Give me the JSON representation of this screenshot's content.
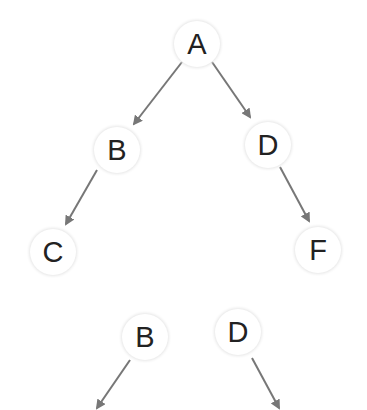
{
  "nodes": [
    {
      "id": "A",
      "label": "A",
      "x": 197,
      "y": 44
    },
    {
      "id": "B",
      "label": "B",
      "x": 117,
      "y": 150
    },
    {
      "id": "D",
      "label": "D",
      "x": 268,
      "y": 145
    },
    {
      "id": "C",
      "label": "C",
      "x": 53,
      "y": 252
    },
    {
      "id": "F",
      "label": "F",
      "x": 318,
      "y": 250
    },
    {
      "id": "B2",
      "label": "B",
      "x": 145,
      "y": 337
    },
    {
      "id": "D2",
      "label": "D",
      "x": 238,
      "y": 332
    }
  ],
  "edges": [
    {
      "from": "A",
      "to": "B"
    },
    {
      "from": "A",
      "to": "D"
    },
    {
      "from": "B",
      "to": "C"
    },
    {
      "from": "D",
      "to": "F"
    },
    {
      "from": "B2",
      "to": "offscreen-left"
    },
    {
      "from": "D2",
      "to": "offscreen-right"
    }
  ],
  "colors": {
    "edge": "#777777",
    "text": "#222222"
  }
}
